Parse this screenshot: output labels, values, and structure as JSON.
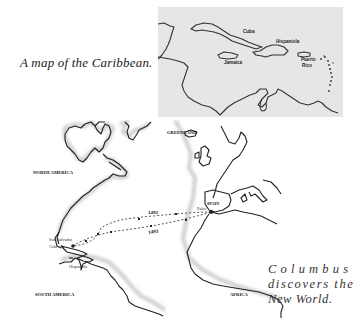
{
  "caribbean_map": {
    "caption": "A map of the Caribbean.",
    "background_color": "#e6e6e6",
    "labels": {
      "cuba": "Cuba",
      "hispaniola": "Hispaniola",
      "jamaica": "Jamaica",
      "puerto_rico_1": "Puerto",
      "puerto_rico_2": "Rico"
    }
  },
  "columbus_map": {
    "caption_line1": "Columbus",
    "caption_line2": "discovers the",
    "caption_line3": "New World.",
    "labels": {
      "greenland": "GREENLAND",
      "north_america": "NORTH AMERICA",
      "south_america": "SOUTH AMERICA",
      "africa": "AFRICA",
      "spain": "SPAIN",
      "palos": "Palos",
      "san_salvador": "San Salvador",
      "cuba": "Cuba",
      "hispaniola": "Hispaniola",
      "route_outbound_year": "1492",
      "route_return_year": "1493"
    }
  }
}
